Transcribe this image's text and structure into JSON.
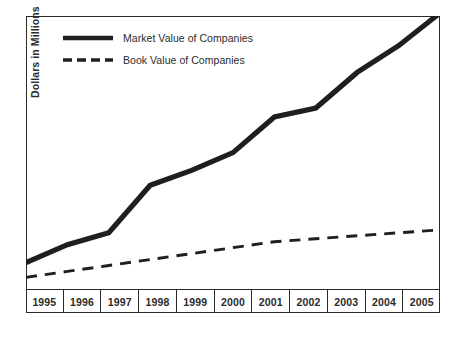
{
  "chart_data": {
    "type": "line",
    "title": "",
    "subtitle": "",
    "xlabel": "",
    "ylabel": "Dollars in Millions",
    "grid": false,
    "legend_position": "top-left",
    "categories": [
      "1995",
      "1996",
      "1997",
      "1998",
      "1999",
      "2000",
      "2001",
      "2002",
      "2003",
      "2004",
      "2005"
    ],
    "xlim": [
      1995,
      2005
    ],
    "ylim": [
      0,
      100
    ],
    "y_axis_ticks_shown": false,
    "series": [
      {
        "name": "Market Value of Companies",
        "style": "solid",
        "color": "#1f1f1f",
        "values": [
          17,
          23,
          27,
          43,
          48,
          54,
          66,
          69,
          81,
          90,
          101
        ]
      },
      {
        "name": "Book Value of Companies",
        "style": "dashed",
        "color": "#1f1f1f",
        "values": [
          12,
          14,
          16,
          18,
          20,
          22,
          24,
          25,
          26,
          27,
          28
        ]
      }
    ],
    "annotations": []
  },
  "axes": {
    "y_title": "Dollars in Millions",
    "x_tick_labels": [
      "1995",
      "1996",
      "1997",
      "1998",
      "1999",
      "2000",
      "2001",
      "2002",
      "2003",
      "2004",
      "2005"
    ]
  },
  "legend": {
    "entries": [
      {
        "label": "Market Value of Companies",
        "style": "solid"
      },
      {
        "label": "Book Value of Companies",
        "style": "dashed"
      }
    ]
  },
  "colors": {
    "line": "#1f1f1f",
    "frame": "#2b2b2b",
    "text": "#2b2b2b",
    "background": "#ffffff"
  }
}
